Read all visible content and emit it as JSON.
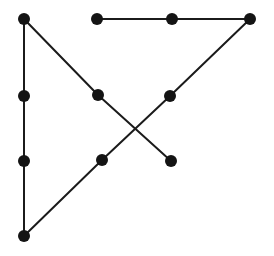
{
  "figure": {
    "background_color": "#ffffff",
    "width": 274,
    "height": 256
  },
  "style": {
    "node_color": "#141414",
    "node_radius": 6,
    "edge_color": "#1b1b1b",
    "edge_width": 2
  },
  "chart_data": {
    "type": "scatter",
    "title": "",
    "subtitle": "",
    "xlabel": "",
    "ylabel": "",
    "grid": false,
    "legend": "none",
    "xlim": [
      0,
      274
    ],
    "ylim": [
      0,
      256
    ],
    "nodes": [
      {
        "id": "n1",
        "label": "",
        "x": 24,
        "y": 19
      },
      {
        "id": "n2",
        "label": "",
        "x": 97,
        "y": 19
      },
      {
        "id": "n3",
        "label": "",
        "x": 172,
        "y": 19
      },
      {
        "id": "n4",
        "label": "",
        "x": 250,
        "y": 19
      },
      {
        "id": "n5",
        "label": "",
        "x": 24,
        "y": 96
      },
      {
        "id": "n6",
        "label": "",
        "x": 98,
        "y": 95
      },
      {
        "id": "n7",
        "label": "",
        "x": 170,
        "y": 96
      },
      {
        "id": "n8",
        "label": "",
        "x": 24,
        "y": 161
      },
      {
        "id": "n9",
        "label": "",
        "x": 102,
        "y": 160
      },
      {
        "id": "n10",
        "label": "",
        "x": 171,
        "y": 161
      },
      {
        "id": "n11",
        "label": "",
        "x": 24,
        "y": 236
      }
    ],
    "edges": [
      {
        "id": "e1",
        "source": "n1",
        "target": "n5",
        "x1": 24,
        "y1": 19,
        "x2": 24,
        "y2": 96
      },
      {
        "id": "e2",
        "source": "n5",
        "target": "n8",
        "x1": 24,
        "y1": 96,
        "x2": 24,
        "y2": 161
      },
      {
        "id": "e3",
        "source": "n8",
        "target": "n11",
        "x1": 24,
        "y1": 161,
        "x2": 24,
        "y2": 236
      },
      {
        "id": "e4",
        "source": "n2",
        "target": "n3",
        "x1": 97,
        "y1": 19,
        "x2": 172,
        "y2": 19
      },
      {
        "id": "e5",
        "source": "n3",
        "target": "n4",
        "x1": 172,
        "y1": 19,
        "x2": 250,
        "y2": 19
      },
      {
        "id": "e6",
        "source": "n1",
        "target": "n6",
        "x1": 24,
        "y1": 19,
        "x2": 98,
        "y2": 95
      },
      {
        "id": "e7",
        "source": "n6",
        "target": "n10",
        "x1": 98,
        "y1": 95,
        "x2": 171,
        "y2": 161
      },
      {
        "id": "e8",
        "source": "n4",
        "target": "n7",
        "x1": 250,
        "y1": 19,
        "x2": 170,
        "y2": 96
      },
      {
        "id": "e9",
        "source": "n7",
        "target": "n9",
        "x1": 170,
        "y1": 96,
        "x2": 102,
        "y2": 160
      },
      {
        "id": "e10",
        "source": "n9",
        "target": "n11",
        "x1": 102,
        "y1": 160,
        "x2": 24,
        "y2": 236
      }
    ],
    "node_count": 11,
    "edge_count": 10,
    "annotations": []
  }
}
